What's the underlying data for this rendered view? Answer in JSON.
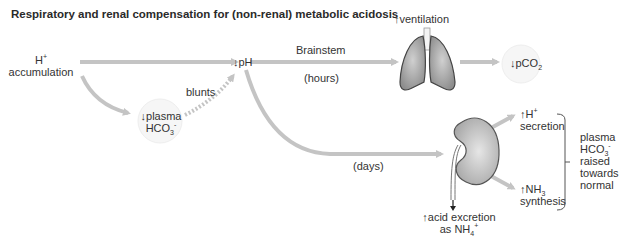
{
  "title": "Respiratory and renal compensation for (non-renal) metabolic acidosis",
  "nodes": {
    "h_accumulation": {
      "main": "H",
      "sup": "+",
      "line2": "accumulation"
    },
    "ph": {
      "arrow": "↓",
      "text": "pH"
    },
    "plasma_hco3": {
      "arrow": "↓",
      "line1": "plasma",
      "line2_main": "HCO",
      "line2_sub": "3",
      "line2_sup": "-"
    },
    "ventilation": {
      "arrow": "↑",
      "text": "ventilation"
    },
    "pco2": {
      "arrow": "↓",
      "main": "pCO",
      "sub": "2"
    },
    "h_secretion": {
      "arrow": "↑",
      "main": "H",
      "sup": "+",
      "line2": "secretion"
    },
    "nh3_synthesis": {
      "arrow": "↑",
      "main": "NH",
      "sub": "3",
      "line2": "synthesis"
    },
    "acid_excretion": {
      "arrow": "↑",
      "line1": "acid excretion",
      "line2_main": "as NH",
      "line2_sub": "4",
      "line2_sup": "+"
    },
    "outcome": {
      "line1": "plasma",
      "line2_main": "HCO",
      "line2_sub": "3",
      "line2_sup": "-",
      "line3": "raised",
      "line4": "towards",
      "line5": "normal"
    }
  },
  "edge_labels": {
    "blunts": "blunts",
    "brainstem": "Brainstem",
    "hours": "(hours)",
    "days": "(days)"
  },
  "colors": {
    "arrow": "#c4c4c4",
    "organ_fill": "#b8b8b8",
    "organ_stroke": "#555555",
    "text": "#333333"
  }
}
